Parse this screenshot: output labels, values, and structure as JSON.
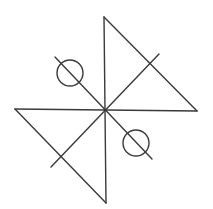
{
  "diagram": {
    "background": "#ffffff",
    "stroke_color": "#3a3a3a",
    "stroke_width": 1.4,
    "center": [
      105,
      110
    ],
    "segments": [
      {
        "name": "vertical-line",
        "x1": 104,
        "y1": 17,
        "x2": 106,
        "y2": 203
      },
      {
        "name": "horizontal-line",
        "x1": 15,
        "y1": 109,
        "x2": 197,
        "y2": 111
      },
      {
        "name": "diagonal-ne-sw",
        "x1": 159,
        "y1": 54,
        "x2": 51,
        "y2": 167
      },
      {
        "name": "diagonal-nw-se",
        "x1": 55,
        "y1": 57,
        "x2": 152,
        "y2": 159
      },
      {
        "name": "triangle-top-right-hypotenuse",
        "x1": 104,
        "y1": 17,
        "x2": 197,
        "y2": 111
      },
      {
        "name": "triangle-bottom-left-hypotenuse",
        "x1": 15,
        "y1": 109,
        "x2": 106,
        "y2": 203
      }
    ],
    "circles": [
      {
        "name": "circle-nw",
        "cx": 70,
        "cy": 73,
        "r": 13
      },
      {
        "name": "circle-se",
        "cx": 136,
        "cy": 143,
        "r": 13
      }
    ]
  }
}
